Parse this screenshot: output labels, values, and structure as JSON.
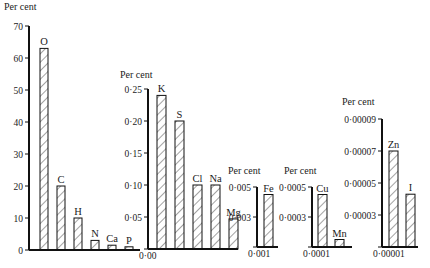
{
  "unit_label": "Per cent",
  "chart_data": [
    {
      "type": "bar",
      "title": "",
      "ylabel": "Per cent",
      "ylim": [
        0,
        70
      ],
      "yticks": [
        "0",
        "10",
        "20",
        "30",
        "40",
        "50",
        "60",
        "70"
      ],
      "categories": [
        "O",
        "C",
        "H",
        "N",
        "Ca",
        "P"
      ],
      "values": [
        63,
        20,
        10,
        3,
        1.5,
        1
      ],
      "grid": false
    },
    {
      "type": "bar",
      "ylabel": "Per cent",
      "ylim": [
        0.0,
        0.25
      ],
      "yticks": [
        "0·00",
        "0·05",
        "0·10",
        "0·15",
        "0·20",
        "0·25"
      ],
      "categories": [
        "K",
        "S",
        "Cl",
        "Na",
        "Mg"
      ],
      "values": [
        0.24,
        0.2,
        0.1,
        0.1,
        0.047
      ],
      "grid": false
    },
    {
      "type": "bar",
      "ylabel": "Per cent",
      "ylim": [
        0.001,
        0.005
      ],
      "yticks": [
        "0·001",
        "0·003",
        "0·005"
      ],
      "categories": [
        "Fe"
      ],
      "values": [
        0.0045
      ],
      "grid": false
    },
    {
      "type": "bar",
      "ylabel": "Per cent",
      "ylim": [
        0.0001,
        0.0005
      ],
      "yticks": [
        "0·0001",
        "0·0003",
        "0·0005"
      ],
      "categories": [
        "Cu",
        "Mn"
      ],
      "values": [
        0.00045,
        0.00015
      ],
      "grid": false
    },
    {
      "type": "bar",
      "ylabel": "Per cent",
      "ylim": [
        1e-05,
        9e-05
      ],
      "yticks": [
        "0·00001",
        "0·00003",
        "0·00005",
        "0·00007",
        "0·00009"
      ],
      "categories": [
        "Zn",
        "I"
      ],
      "values": [
        7e-05,
        4.3e-05
      ],
      "grid": false
    }
  ]
}
